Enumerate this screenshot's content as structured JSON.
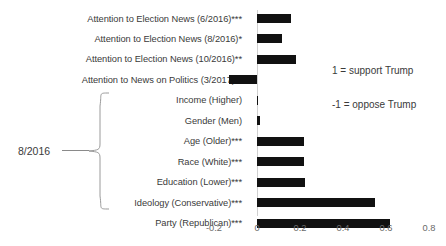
{
  "chart_data": {
    "type": "bar",
    "orientation": "horizontal",
    "title": "",
    "subtitle": "",
    "xlabel": "",
    "ylabel": "",
    "xlim": [
      -0.2,
      0.8
    ],
    "xticks": [
      -0.2,
      0,
      0.2,
      0.4,
      0.6,
      0.8
    ],
    "xtick_labels": [
      "-0.2",
      "0",
      "0.2",
      "0.4",
      "0.6",
      "0.8"
    ],
    "grid": false,
    "legend_position": "right-inside",
    "bar_color": "#111111",
    "axis_color": "#d0d0d0",
    "categories": [
      "Attention to Election News (6/2016)***",
      "Attention to Election News (8/2016)*",
      "Attention to Election News (10/2016)**",
      "Attention to News on Politics (3/2017)**",
      "Income (Higher)",
      "Gender (Men)",
      "Age (Older)***",
      "Race (White)***",
      "Education (Lower)***",
      "Ideology (Conservative)***",
      "Party (Republican)***"
    ],
    "values": [
      0.16,
      0.115,
      0.18,
      -0.13,
      0.005,
      0.015,
      0.22,
      0.22,
      0.225,
      0.55,
      0.62
    ],
    "annotations": [
      "1 = support Trump",
      "-1 = oppose Trump"
    ],
    "group_bracket": {
      "label": "8/2016",
      "covers_categories": [
        "Income (Higher)",
        "Gender (Men)",
        "Age (Older)***",
        "Race (White)***",
        "Education (Lower)***",
        "Ideology (Conservative)***",
        "Party (Republican)***"
      ]
    }
  }
}
